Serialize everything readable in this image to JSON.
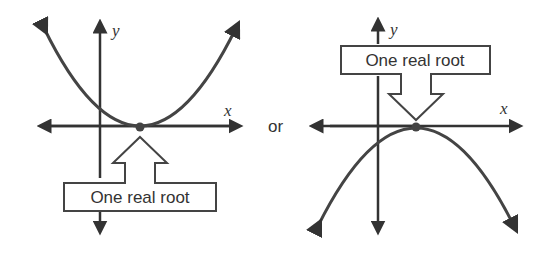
{
  "diagram": {
    "left_panel": {
      "x_axis_label": "x",
      "y_axis_label": "y",
      "curve": "upward parabola tangent to x-axis",
      "callout": "One real root"
    },
    "connector": "or",
    "right_panel": {
      "x_axis_label": "x",
      "y_axis_label": "y",
      "curve": "downward parabola tangent to x-axis",
      "callout": "One real root"
    },
    "colors": {
      "ink": "#333333",
      "background": "#ffffff"
    }
  }
}
